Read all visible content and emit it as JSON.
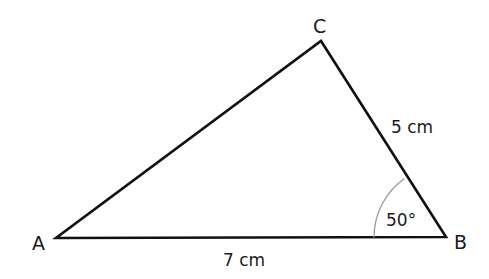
{
  "diagram": {
    "type": "triangle",
    "vertices": {
      "A": {
        "label": "A"
      },
      "B": {
        "label": "B"
      },
      "C": {
        "label": "C"
      }
    },
    "sides": {
      "AB": {
        "label": "7 cm"
      },
      "BC": {
        "label": "5 cm"
      }
    },
    "angles": {
      "B": {
        "label": "50°"
      }
    },
    "colors": {
      "line": "#111111",
      "arc": "#999999",
      "text": "#1a1a1a"
    }
  }
}
